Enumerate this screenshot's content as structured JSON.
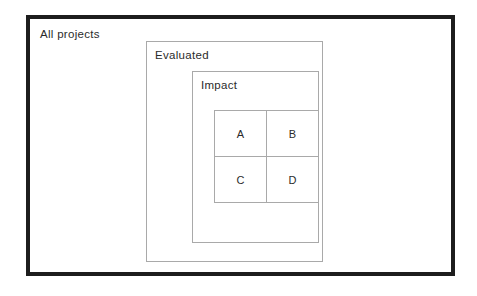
{
  "diagram": {
    "type": "nested-set-venn",
    "sets": {
      "outer": {
        "label": "All projects",
        "border_color": "#1d1d1d"
      },
      "middle": {
        "label": "Evaluated",
        "border_color": "#a9a9a9"
      },
      "inner": {
        "label": "Impact",
        "border_color": "#a9a9a9"
      }
    },
    "quadrants": [
      {
        "id": "a",
        "label": "A"
      },
      {
        "id": "b",
        "label": "B"
      },
      {
        "id": "c",
        "label": "C"
      },
      {
        "id": "d",
        "label": "D"
      }
    ]
  }
}
